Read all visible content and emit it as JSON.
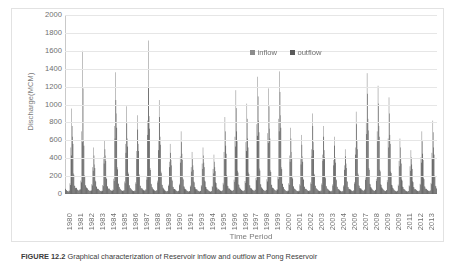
{
  "figure": {
    "caption_label": "FIGURE 12.2",
    "caption_text": "Graphical characterization of Reservoir inflow and outflow at Pong Reservoir"
  },
  "chart_data": {
    "type": "bar",
    "title": "",
    "xlabel": "Time Period",
    "ylabel": "Discharge(MCM)",
    "ylim": [
      0,
      2000
    ],
    "ytick_step": 200,
    "yticks": [
      0,
      200,
      400,
      600,
      800,
      1000,
      1200,
      1400,
      1600,
      1800,
      2000
    ],
    "grid": true,
    "legend_position": "top-center",
    "x_tick_labels": [
      "1980",
      "1981",
      "1982",
      "1983",
      "1984",
      "1985",
      "1986",
      "1987",
      "1988",
      "1989",
      "1990",
      "1991",
      "1993",
      "1994",
      "1995",
      "1996",
      "1996",
      "1997",
      "1998",
      "1999",
      "2000",
      "2001",
      "2002",
      "2003",
      "2003",
      "2004",
      "2006",
      "2007",
      "2008",
      "2009",
      "2009",
      "2011",
      "2012",
      "2013"
    ],
    "x_range": [
      "1980",
      "2013"
    ],
    "series": [
      {
        "name": "inflow",
        "color": "#8c8c8c",
        "values": [
          60,
          45,
          35,
          30,
          40,
          120,
          520,
          955,
          640,
          230,
          95,
          70,
          70,
          50,
          40,
          45,
          55,
          150,
          700,
          1600,
          600,
          210,
          100,
          75,
          65,
          48,
          38,
          35,
          42,
          110,
          300,
          520,
          330,
          150,
          85,
          60,
          58,
          44,
          36,
          32,
          38,
          100,
          410,
          600,
          430,
          180,
          88,
          62,
          62,
          46,
          40,
          38,
          50,
          170,
          760,
          1360,
          900,
          300,
          120,
          80,
          60,
          45,
          38,
          34,
          44,
          140,
          560,
          980,
          620,
          240,
          100,
          70,
          58,
          44,
          36,
          33,
          40,
          130,
          480,
          880,
          560,
          220,
          95,
          68,
          64,
          50,
          42,
          40,
          52,
          190,
          820,
          1715,
          870,
          290,
          115,
          78,
          60,
          46,
          38,
          35,
          44,
          150,
          600,
          1050,
          640,
          250,
          105,
          72,
          55,
          42,
          34,
          30,
          36,
          105,
          360,
          560,
          380,
          160,
          82,
          58,
          56,
          43,
          35,
          31,
          38,
          115,
          420,
          700,
          450,
          175,
          86,
          60,
          52,
          40,
          33,
          29,
          34,
          95,
          300,
          470,
          320,
          140,
          78,
          55,
          54,
          41,
          34,
          30,
          36,
          100,
          340,
          520,
          350,
          150,
          80,
          56,
          50,
          39,
          32,
          28,
          33,
          90,
          280,
          440,
          300,
          130,
          74,
          52,
          58,
          45,
          37,
          33,
          41,
          125,
          470,
          860,
          540,
          210,
          92,
          64,
          62,
          48,
          40,
          36,
          46,
          160,
          640,
          1160,
          700,
          260,
          108,
          74,
          60,
          46,
          38,
          34,
          43,
          145,
          580,
          1010,
          620,
          240,
          100,
          70,
          64,
          50,
          42,
          38,
          50,
          180,
          780,
          1310,
          820,
          285,
          112,
          76,
          62,
          48,
          40,
          36,
          47,
          165,
          680,
          1180,
          730,
          265,
          106,
          73,
          66,
          52,
          43,
          39,
          53,
          195,
          840,
          1370,
          880,
          300,
          118,
          80,
          56,
          44,
          36,
          32,
          40,
          120,
          430,
          740,
          470,
          185,
          88,
          62,
          54,
          42,
          35,
          31,
          38,
          110,
          390,
          660,
          420,
          170,
          84,
          60,
          58,
          45,
          37,
          33,
          42,
          130,
          500,
          900,
          580,
          225,
          96,
          66,
          56,
          43,
          36,
          32,
          40,
          118,
          440,
          760,
          490,
          190,
          90,
          63,
          54,
          42,
          34,
          30,
          37,
          108,
          380,
          640,
          410,
          165,
          83,
          59,
          52,
          40,
          33,
          29,
          35,
          98,
          320,
          500,
          340,
          145,
          79,
          56,
          58,
          45,
          37,
          33,
          42,
          135,
          520,
          920,
          590,
          230,
          97,
          67,
          64,
          50,
          42,
          38,
          51,
          185,
          800,
          1350,
          840,
          290,
          114,
          77,
          62,
          48,
          40,
          36,
          48,
          170,
          700,
          1210,
          760,
          270,
          108,
          74,
          60,
          46,
          38,
          34,
          45,
          155,
          620,
          1080,
          660,
          250,
          102,
          71,
          54,
          42,
          35,
          31,
          37,
          105,
          370,
          620,
          400,
          162,
          82,
          58,
          52,
          40,
          33,
          29,
          34,
          96,
          310,
          490,
          330,
          142,
          78,
          55,
          56,
          44,
          36,
          32,
          39,
          114,
          410,
          700,
          450,
          178,
          86,
          61,
          58,
          45,
          37,
          33,
          41,
          124,
          460,
          820,
          520,
          205,
          91,
          64
        ]
      },
      {
        "name": "outflow",
        "color": "#5a5a5a",
        "values": [
          55,
          42,
          33,
          28,
          36,
          100,
          430,
          760,
          560,
          215,
          90,
          66,
          66,
          48,
          38,
          42,
          50,
          130,
          580,
          1180,
          540,
          195,
          95,
          71,
          61,
          45,
          36,
          33,
          39,
          95,
          260,
          430,
          290,
          140,
          81,
          57,
          54,
          41,
          34,
          30,
          35,
          88,
          340,
          500,
          370,
          168,
          84,
          59,
          58,
          43,
          37,
          35,
          46,
          145,
          620,
          1050,
          740,
          275,
          112,
          76,
          56,
          42,
          36,
          32,
          41,
          120,
          460,
          790,
          530,
          222,
          95,
          67,
          54,
          41,
          34,
          31,
          37,
          112,
          400,
          720,
          480,
          205,
          90,
          64,
          60,
          47,
          39,
          37,
          48,
          160,
          660,
          1190,
          730,
          268,
          109,
          74,
          56,
          43,
          36,
          33,
          41,
          128,
          490,
          860,
          550,
          232,
          100,
          69,
          51,
          39,
          32,
          28,
          34,
          90,
          300,
          460,
          320,
          148,
          78,
          55,
          52,
          40,
          33,
          29,
          35,
          98,
          350,
          580,
          380,
          162,
          82,
          57,
          49,
          37,
          31,
          27,
          32,
          82,
          250,
          390,
          270,
          130,
          74,
          52,
          51,
          38,
          32,
          28,
          34,
          86,
          280,
          430,
          300,
          140,
          76,
          53,
          47,
          36,
          30,
          26,
          31,
          78,
          230,
          360,
          255,
          122,
          70,
          49,
          54,
          42,
          35,
          31,
          38,
          106,
          390,
          700,
          450,
          196,
          87,
          61,
          58,
          45,
          37,
          34,
          43,
          136,
          530,
          960,
          590,
          240,
          102,
          70,
          56,
          43,
          36,
          32,
          40,
          124,
          480,
          840,
          520,
          222,
          95,
          66,
          60,
          47,
          39,
          36,
          46,
          154,
          650,
          1090,
          690,
          262,
          106,
          72,
          58,
          45,
          37,
          34,
          44,
          140,
          570,
          980,
          620,
          246,
          100,
          69,
          62,
          49,
          40,
          37,
          49,
          166,
          700,
          1140,
          740,
          278,
          112,
          76,
          52,
          41,
          34,
          30,
          37,
          102,
          360,
          620,
          400,
          172,
          83,
          58,
          50,
          39,
          33,
          29,
          35,
          94,
          330,
          550,
          360,
          158,
          80,
          56,
          54,
          42,
          35,
          31,
          39,
          112,
          420,
          760,
          490,
          208,
          90,
          62,
          52,
          40,
          34,
          30,
          37,
          100,
          370,
          640,
          410,
          176,
          85,
          59,
          50,
          39,
          32,
          28,
          34,
          92,
          320,
          540,
          350,
          154,
          79,
          55,
          48,
          37,
          31,
          27,
          32,
          84,
          270,
          420,
          290,
          136,
          75,
          53,
          54,
          42,
          35,
          31,
          39,
          116,
          440,
          780,
          500,
          214,
          91,
          63,
          60,
          47,
          39,
          36,
          47,
          158,
          670,
          1120,
          710,
          270,
          108,
          73,
          58,
          45,
          37,
          34,
          45,
          146,
          590,
          1010,
          640,
          252,
          102,
          70,
          56,
          43,
          36,
          32,
          42,
          132,
          520,
          900,
          560,
          234,
          97,
          67,
          50,
          39,
          32,
          28,
          35,
          90,
          310,
          520,
          340,
          150,
          78,
          55,
          48,
          37,
          31,
          27,
          33,
          86,
          260,
          410,
          280,
          132,
          74,
          52,
          52,
          41,
          34,
          30,
          37,
          104,
          350,
          590,
          380,
          166,
          82,
          58,
          54,
          42,
          35,
          31,
          38,
          110,
          390,
          690,
          440,
          190,
          86,
          60
        ]
      }
    ]
  }
}
